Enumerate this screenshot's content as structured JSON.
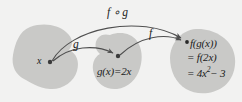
{
  "diagram": {
    "colors": {
      "background": "#f2f2f1",
      "blob_fill": "#c9c9c7",
      "arrow": "#555555",
      "text": "#1b1b1b",
      "dot": "#3a3a3a"
    },
    "labels": {
      "composition": "f ∘ g",
      "inner_map": "g",
      "outer_map": "f",
      "domain_point": "x",
      "middle_value": "g(x)=2x",
      "result_line_1": "f(g(x))",
      "result_line_2": "= f(2x)",
      "result_line_3_prefix": "= 4x",
      "result_line_3_exponent": "2",
      "result_line_3_suffix": "− 3"
    },
    "sets": [
      {
        "name": "domain-set",
        "contains": "x"
      },
      {
        "name": "intermediate-set",
        "contains": "g(x)=2x"
      },
      {
        "name": "codomain-set",
        "contains": "f(g(x))"
      }
    ],
    "arrows": [
      {
        "name": "arrow-g",
        "from": "x",
        "to": "g(x)",
        "label": "g"
      },
      {
        "name": "arrow-f",
        "from": "g(x)",
        "to": "f(g(x))",
        "label": "f"
      },
      {
        "name": "arrow-f-of-g",
        "from": "x",
        "to": "f(g(x))",
        "label": "f ∘ g"
      }
    ],
    "points": [
      {
        "name": "point-x",
        "x": 50,
        "y": 62
      },
      {
        "name": "point-gx",
        "x": 118,
        "y": 56
      },
      {
        "name": "point-fgx",
        "x": 187,
        "y": 42
      }
    ]
  }
}
